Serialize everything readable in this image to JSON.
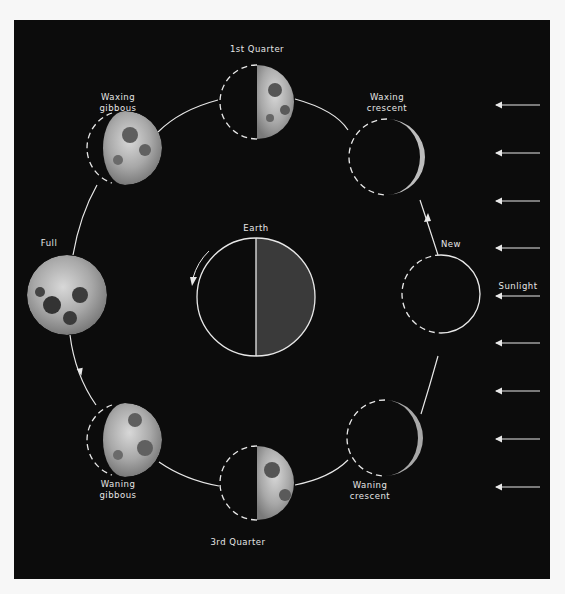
{
  "diagram": {
    "center": {
      "label": "Earth"
    },
    "sunlight_label": "Sunlight",
    "phases": [
      {
        "id": "new",
        "label_lines": [
          "New"
        ]
      },
      {
        "id": "waxing-crescent",
        "label_lines": [
          "Waxing",
          "crescent"
        ]
      },
      {
        "id": "first-quarter",
        "label_lines": [
          "1st Quarter"
        ]
      },
      {
        "id": "waxing-gibbous",
        "label_lines": [
          "Waxing",
          "gibbous"
        ]
      },
      {
        "id": "full",
        "label_lines": [
          "Full"
        ]
      },
      {
        "id": "waning-gibbous",
        "label_lines": [
          "Waning",
          "gibbous"
        ]
      },
      {
        "id": "third-quarter",
        "label_lines": [
          "3rd Quarter"
        ]
      },
      {
        "id": "waning-crescent",
        "label_lines": [
          "Waning",
          "crescent"
        ]
      }
    ],
    "sunlight_arrow_count": 9,
    "colors": {
      "background": "#0c0c0c",
      "page": "#f7f7f7",
      "line": "#e8e8e8",
      "earth_lit": "#3a3a3a",
      "earth_dark": "#0c0c0c"
    }
  }
}
